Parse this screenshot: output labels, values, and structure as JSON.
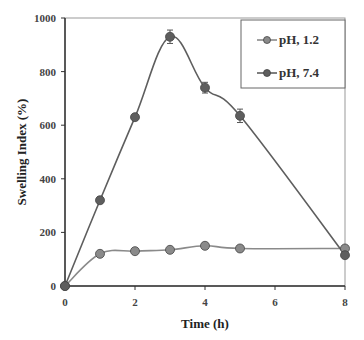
{
  "chart_data": {
    "type": "line",
    "title": "",
    "xlabel": "Time (h)",
    "ylabel": "Swelling Index (%)",
    "xlim": [
      0,
      8
    ],
    "ylim": [
      0,
      1000
    ],
    "xticks": [
      "0",
      "2",
      "4",
      "6",
      "8"
    ],
    "yticks": [
      "0",
      "200",
      "400",
      "600",
      "800",
      "1000"
    ],
    "grid": false,
    "legend_position": "upper right",
    "x": [
      0,
      1,
      2,
      3,
      4,
      5,
      8
    ],
    "series": [
      {
        "name": "pH, 1.2",
        "values": [
          0,
          120,
          130,
          135,
          150,
          140,
          140
        ],
        "color": "#8a8a8a"
      },
      {
        "name": "pH, 7.4",
        "values": [
          0,
          320,
          630,
          930,
          740,
          635,
          115
        ],
        "color": "#5e5e5e",
        "error_bars": [
          0,
          12,
          10,
          25,
          20,
          25,
          0
        ]
      }
    ]
  }
}
